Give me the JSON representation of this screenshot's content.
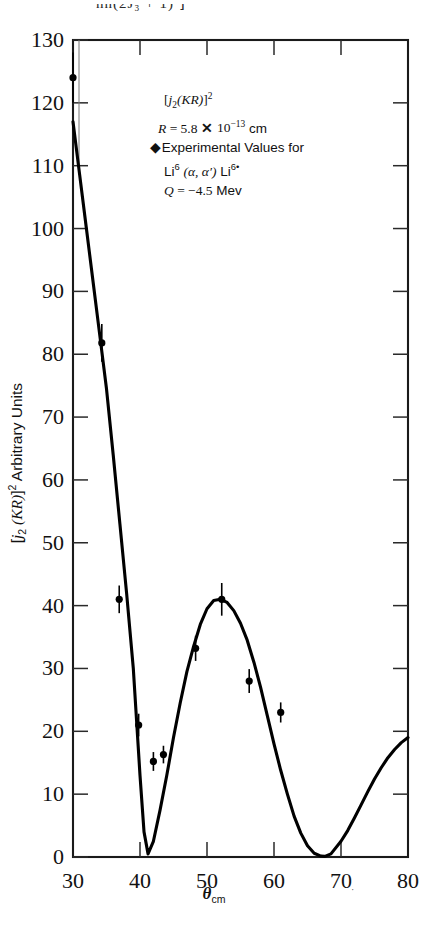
{
  "figure": {
    "cut_header_fragment": "nn(2J₃ + 1)      ⌋",
    "x_axis_label": "θcm",
    "y_axis_label": "[j₂(KR)]² Arbitrary Units"
  },
  "annotation": {
    "line1": "[j₂(KR)]²",
    "line2": "R = 5.8 × 10⁻¹³ cm",
    "line3": "Experimental Values for",
    "line4": "Li⁶ (α, α′) Li⁶*",
    "line5": "Q = −4.5 Mev",
    "marker_glyph": "errorbar-marker"
  },
  "chart_data": {
    "type": "line",
    "title": "",
    "subtitle": "",
    "xlabel": "θcm",
    "ylabel": "[j₂(KR)]² Arbitrary Units",
    "xlim": [
      30,
      80
    ],
    "ylim": [
      0,
      130
    ],
    "grid": false,
    "legend_position": "inside-upper-center",
    "x_ticks": [
      30,
      40,
      50,
      60,
      70,
      80
    ],
    "x_tick_labels": [
      "30",
      "40",
      "50",
      "60",
      "70",
      "80"
    ],
    "y_ticks": [
      0,
      10,
      20,
      30,
      40,
      50,
      60,
      70,
      80,
      90,
      100,
      110,
      120,
      130
    ],
    "y_tick_labels": [
      "0",
      "10",
      "20",
      "30",
      "40",
      "50",
      "60",
      "70",
      "80",
      "90",
      "100",
      "110",
      "120",
      "130"
    ],
    "series": [
      {
        "name": "[j₂(KR)]² theory curve",
        "type": "line",
        "color": "#000000",
        "x": [
          30.0,
          31.0,
          32.0,
          33.0,
          34.0,
          35.0,
          36.0,
          37.0,
          38.0,
          39.0,
          40.0,
          40.6,
          41.2,
          42.0,
          43.0,
          44.0,
          45.0,
          46.0,
          47.0,
          48.0,
          49.0,
          50.0,
          51.0,
          52.0,
          53.0,
          54.0,
          55.0,
          56.0,
          57.0,
          58.0,
          59.0,
          60.0,
          61.0,
          62.0,
          63.0,
          64.0,
          65.0,
          66.0,
          67.0,
          67.6,
          68.5,
          70.0,
          71.0,
          72.0,
          73.0,
          74.0,
          75.0,
          76.0,
          77.0,
          78.0,
          79.0,
          80.0
        ],
        "y": [
          117.0,
          108.5,
          100.0,
          91.5,
          83.0,
          74.5,
          64.0,
          53.0,
          42.0,
          30.0,
          13.0,
          4.0,
          0.5,
          2.5,
          7.5,
          13.0,
          19.0,
          24.5,
          29.5,
          33.5,
          37.0,
          39.5,
          40.8,
          41.0,
          40.5,
          39.2,
          37.2,
          34.5,
          31.0,
          27.0,
          22.5,
          18.0,
          13.8,
          10.0,
          6.5,
          3.8,
          1.8,
          0.6,
          0.15,
          0.1,
          0.5,
          2.5,
          4.2,
          6.2,
          8.3,
          10.4,
          12.4,
          14.2,
          15.8,
          17.1,
          18.2,
          19.0
        ]
      },
      {
        "name": "Experimental Values for Li6 (α, α′) Li6*",
        "type": "scatter",
        "color": "#000000",
        "marker": "filled-circle-with-errorbars",
        "points": [
          {
            "x": 30.0,
            "y": 124.0,
            "yerr": 4.0
          },
          {
            "x": 34.3,
            "y": 81.8,
            "yerr": 3.0
          },
          {
            "x": 36.9,
            "y": 41.0,
            "yerr": 2.2
          },
          {
            "x": 39.8,
            "y": 21.0,
            "yerr": 1.8
          },
          {
            "x": 42.0,
            "y": 15.2,
            "yerr": 1.5
          },
          {
            "x": 43.5,
            "y": 16.3,
            "yerr": 1.4
          },
          {
            "x": 48.3,
            "y": 33.2,
            "yerr": 2.0
          },
          {
            "x": 52.2,
            "y": 41.0,
            "yerr": 2.6
          },
          {
            "x": 56.3,
            "y": 28.0,
            "yerr": 1.9
          },
          {
            "x": 61.0,
            "y": 23.0,
            "yerr": 1.6
          }
        ]
      }
    ]
  }
}
